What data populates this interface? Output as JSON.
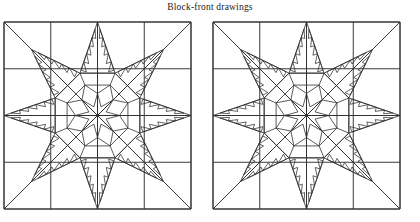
{
  "caption": {
    "text": "Block-front drawings"
  },
  "figure": {
    "type": "line-drawing",
    "block_count": 2,
    "line_color": "#30302f",
    "background_color": "#ffffff",
    "blocks": [
      {
        "label": "left-block",
        "x": 3,
        "y": 5,
        "size": 187,
        "grid_divisions": 4,
        "star_points": 8,
        "feather_teeth_per_edge": 5,
        "center_rings": 2,
        "inner_star_points": 8
      },
      {
        "label": "right-block",
        "x": 212,
        "y": 5,
        "size": 187,
        "grid_divisions": 4,
        "star_points": 8,
        "feather_teeth_per_edge": 5,
        "center_rings": 2,
        "inner_star_points": 8
      }
    ],
    "geometry": {
      "octagon_outer_ratio": 0.245,
      "octagon_middle_ratio": 0.176,
      "inner_star_outer_ratio": 0.118,
      "inner_star_inner_ratio": 0.05,
      "star_point_tip_ratio": 0.5,
      "star_point_base_ratio": 0.245
    }
  }
}
